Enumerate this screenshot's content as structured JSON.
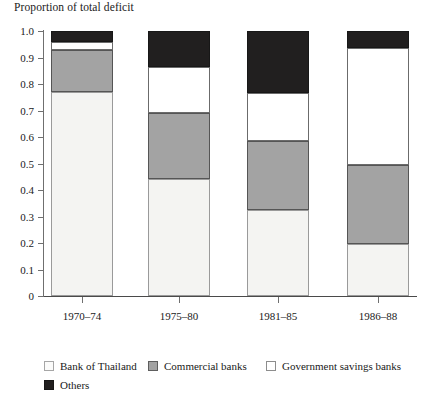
{
  "chart_data": {
    "type": "bar",
    "subtype": "stacked-100",
    "title": "Proportion of total deficit",
    "xlabel": "",
    "ylabel": "Proportion of total deficit",
    "ylim": [
      0,
      1.0
    ],
    "ytick_values": [
      1.0,
      0.9,
      0.8,
      0.7,
      0.6,
      0.5,
      0.4,
      0.3,
      0.2,
      0.1,
      0
    ],
    "ytick_labels": [
      "1.0",
      "0.9",
      "0.8",
      "0.7",
      "0.6",
      "0.5",
      "0.4",
      "0.3",
      "0.2",
      "0.1",
      "0"
    ],
    "grid": false,
    "legend_position": "bottom-left",
    "categories": [
      "1970–74",
      "1975–80",
      "1981–85",
      "1986–88"
    ],
    "series": [
      {
        "name": "Bank of Thailand",
        "color": "#f4f4f2",
        "values": [
          0.77,
          0.44,
          0.325,
          0.195
        ]
      },
      {
        "name": "Commercial banks",
        "color": "#a3a3a3",
        "values": [
          0.16,
          0.25,
          0.26,
          0.3
        ]
      },
      {
        "name": "Government savings banks",
        "color": "#ffffff",
        "values": [
          0.028,
          0.175,
          0.18,
          0.44
        ]
      },
      {
        "name": "Others",
        "color": "#211f1f",
        "values": [
          0.042,
          0.135,
          0.235,
          0.065
        ]
      }
    ],
    "cumulative_tops": [
      [
        0.77,
        0.93,
        0.958,
        1.0
      ],
      [
        0.44,
        0.69,
        0.865,
        1.0
      ],
      [
        0.325,
        0.585,
        0.765,
        1.0
      ],
      [
        0.195,
        0.495,
        0.935,
        1.0
      ]
    ]
  },
  "legend": {
    "items": [
      {
        "label": "Bank of Thailand",
        "swatch": "c-bot"
      },
      {
        "label": "Commercial banks",
        "swatch": "c-commer"
      },
      {
        "label": "Government savings banks",
        "swatch": "c-govsav"
      },
      {
        "label": "Others",
        "swatch": "c-others"
      }
    ]
  }
}
